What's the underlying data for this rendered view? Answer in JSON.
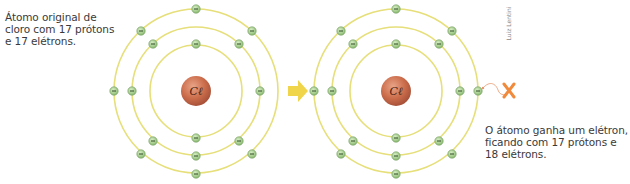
{
  "captions": {
    "left": "Átomo original de\ncloro com 17 prótons\ne 17 elétrons.",
    "right": "O átomo ganha um elétron,\nficando com 17 prótons e\n18 elétrons."
  },
  "credit": "Luiz Lentini",
  "atoms": [
    {
      "id": "original",
      "symbol": "Cℓ",
      "center": [
        196,
        91
      ],
      "rings": [
        46,
        64,
        82
      ],
      "electrons": [
        [
          196,
          44
        ],
        [
          196,
          138
        ],
        [
          153,
          44
        ],
        [
          239,
          44
        ],
        [
          153,
          141
        ],
        [
          239,
          141
        ],
        [
          132,
          91
        ],
        [
          260,
          91
        ],
        [
          196,
          156
        ],
        [
          196,
          9
        ],
        [
          196,
          174
        ],
        [
          141,
          31
        ],
        [
          252,
          31
        ],
        [
          141,
          154
        ],
        [
          252,
          154
        ],
        [
          114,
          91
        ]
      ],
      "electron_sign": "−"
    },
    {
      "id": "ion",
      "symbol": "Cℓ",
      "center": [
        396,
        91
      ],
      "rings": [
        46,
        64,
        82
      ],
      "electrons": [
        [
          396,
          44
        ],
        [
          396,
          138
        ],
        [
          353,
          44
        ],
        [
          439,
          44
        ],
        [
          353,
          141
        ],
        [
          439,
          141
        ],
        [
          332,
          91
        ],
        [
          460,
          91
        ],
        [
          396,
          156
        ],
        [
          396,
          9
        ],
        [
          396,
          174
        ],
        [
          341,
          31
        ],
        [
          452,
          31
        ],
        [
          341,
          154
        ],
        [
          452,
          154
        ],
        [
          314,
          91
        ],
        [
          478,
          91
        ]
      ],
      "electron_sign": "−"
    }
  ],
  "arrow": {
    "icon": "right-arrow-icon",
    "color": "#f0d44a"
  },
  "incoming_electron": {
    "icon": "x-mark-icon",
    "color": "#f08a3c"
  },
  "colors": {
    "ring": "#e6df7a",
    "electron_fill": "#a8d08a",
    "electron_stroke": "#6e9a5a",
    "nucleus": "#c86a4a"
  }
}
